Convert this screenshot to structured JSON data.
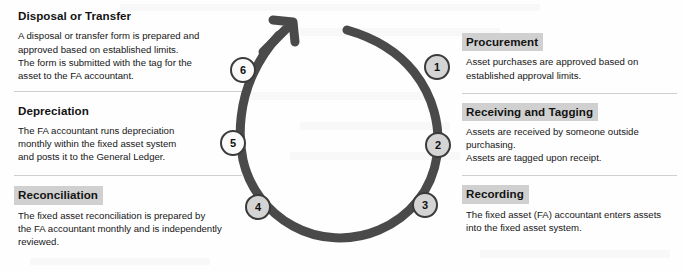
{
  "diagram": {
    "type": "cyclical-process-flow",
    "arc": {
      "color": "#4a4a4a",
      "stroke_width": 9,
      "direction": "counter-clockwise",
      "arrow_label": "arrow-head"
    },
    "highlight_color": "#d0d0d0",
    "nodes": [
      {
        "number": "1",
        "label": "Procurement",
        "x": 232,
        "y": 67,
        "fill": "#d4d4d4"
      },
      {
        "number": "2",
        "label": "Receiving and Tagging",
        "x": 233,
        "y": 145,
        "fill": "#d4d4d4"
      },
      {
        "number": "3",
        "label": "Recording",
        "x": 220,
        "y": 205,
        "fill": "#d4d4d4"
      },
      {
        "number": "4",
        "label": "Reconciliation",
        "x": 53,
        "y": 207,
        "fill": "#d4d4d4"
      },
      {
        "number": "5",
        "label": "Depreciation",
        "x": 28,
        "y": 143,
        "fill": "#fafafa"
      },
      {
        "number": "6",
        "label": "Disposal or Transfer",
        "x": 38,
        "y": 70,
        "fill": "#fafafa"
      }
    ]
  },
  "left_column": {
    "blocks": [
      {
        "heading": "Disposal or Transfer",
        "highlighted": false,
        "body": "A disposal or transfer form is prepared and\napproved based on established limits.\nThe form is submitted with the tag for the\nasset to the FA accountant."
      },
      {
        "heading": "Depreciation",
        "highlighted": false,
        "body": "The FA accountant runs depreciation\nmonthly within the fixed asset system\nand posts it to the General Ledger."
      },
      {
        "heading": "Reconciliation",
        "highlighted": true,
        "body": "The fixed asset reconciliation is prepared by\nthe FA accountant monthly and is independently\nreviewed."
      }
    ]
  },
  "right_column": {
    "blocks": [
      {
        "heading": "Procurement",
        "highlighted": true,
        "body": "Asset purchases are approved based on\nestablished approval limits."
      },
      {
        "heading": "Receiving and Tagging",
        "highlighted": true,
        "body": "Assets are received by someone outside\npurchasing.\nAssets are tagged upon receipt."
      },
      {
        "heading": "Recording",
        "highlighted": true,
        "body": "The fixed asset (FA) accountant enters assets\ninto the fixed asset system."
      }
    ]
  }
}
